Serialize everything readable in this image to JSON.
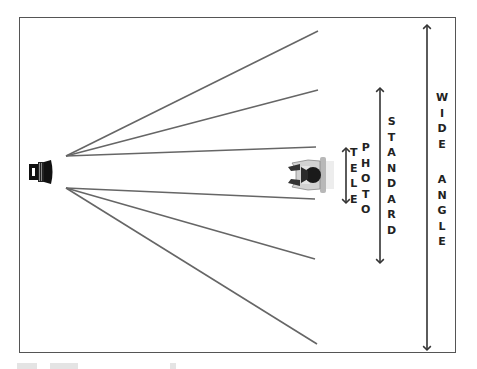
{
  "diagram": {
    "title_visible": false,
    "frame": {
      "x": 19,
      "y": 17,
      "width": 437,
      "height": 336,
      "stroke": "#555555"
    },
    "camera": {
      "icon": "camera-lens-icon",
      "x": 29,
      "y": 160
    },
    "subject": {
      "icon": "seated-person-topdown-icon",
      "x": 288,
      "y": 157
    },
    "line_color": "#666666",
    "sight_lines": [
      {
        "name": "wide-top",
        "from": [
          66,
          156
        ],
        "to": [
          318,
          31
        ]
      },
      {
        "name": "standard-top",
        "from": [
          66,
          156
        ],
        "to": [
          318,
          90
        ]
      },
      {
        "name": "tele-top",
        "from": [
          66,
          156
        ],
        "to": [
          316,
          147
        ]
      },
      {
        "name": "tele-bottom",
        "from": [
          66,
          188
        ],
        "to": [
          315,
          199
        ]
      },
      {
        "name": "standard-bottom",
        "from": [
          66,
          188
        ],
        "to": [
          315,
          259
        ]
      },
      {
        "name": "wide-bottom",
        "from": [
          66,
          188
        ],
        "to": [
          317,
          344
        ]
      }
    ],
    "ranges": [
      {
        "name": "telephoto",
        "arrow_x": 346,
        "y1": 148,
        "y2": 203,
        "label_parts": [
          {
            "letters": [
              "T",
              "E",
              "L",
              "E"
            ],
            "x": 356,
            "y": 145
          },
          {
            "letters": [
              "P",
              "H",
              "O",
              "T",
              "O"
            ],
            "x": 367,
            "y": 140
          }
        ]
      },
      {
        "name": "standard",
        "arrow_x": 380,
        "y1": 88,
        "y2": 263,
        "label_parts": [
          {
            "letters": [
              "S",
              "T",
              "A",
              "N",
              "D",
              "A",
              "R",
              "D"
            ],
            "x": 393,
            "y": 114
          }
        ]
      },
      {
        "name": "wide-angle",
        "arrow_x": 427,
        "y1": 25,
        "y2": 350,
        "label_parts": [
          {
            "letters": [
              "W",
              "I",
              "D",
              "E",
              " ",
              "A",
              "N",
              "G",
              "L",
              "E"
            ],
            "x": 442,
            "y": 90
          }
        ]
      }
    ],
    "labels": {
      "tele": "TELE",
      "photo": "PHOTO",
      "standard": "STANDARD",
      "wide_angle": "WIDE ANGLE"
    }
  }
}
